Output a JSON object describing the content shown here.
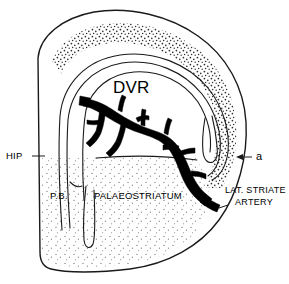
{
  "figure": {
    "background_color": "#ffffff",
    "line_color": "#1a1a1a",
    "artery_color": "#000000",
    "stipple_color": "#3a3a3a"
  },
  "labels": {
    "dvr": "DVR",
    "hip": "HIP",
    "pb": "P.B.",
    "palaeostriatum": "PALAEOSTRIATUM",
    "artery_line1": "LAT. STRIATE",
    "artery_line2": "ARTERY",
    "marker_a": "a"
  },
  "annotations": [
    {
      "name": "hip-leader",
      "label": "HIP",
      "points_to": "left-cortical-border"
    },
    {
      "name": "a-arrow",
      "label": "a",
      "points_to": "outer-surface-right"
    },
    {
      "name": "artery-label",
      "label": "LAT. STRIATE ARTERY",
      "points_to": "artery-trunk-exit"
    }
  ],
  "regions": [
    {
      "name": "hyperpallium-band",
      "fill": "stipple-dense"
    },
    {
      "name": "dvr",
      "fill": "none"
    },
    {
      "name": "palaeostriatum",
      "fill": "stipple-light"
    },
    {
      "name": "ventricle",
      "fill": "white"
    }
  ]
}
